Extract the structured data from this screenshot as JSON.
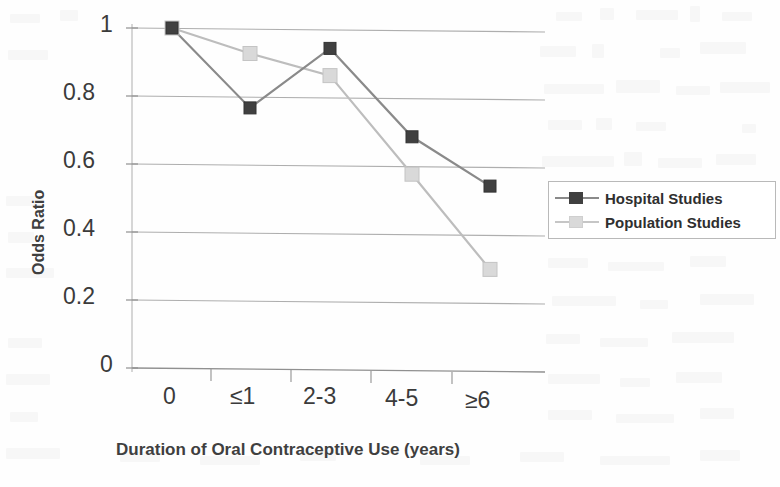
{
  "chart_data": {
    "type": "line",
    "title": "",
    "xlabel": "Duration of Oral Contraceptive Use (years)",
    "ylabel": "Odds Ratio",
    "categories": [
      "0",
      "≤1",
      "2-3",
      "4-5",
      "≥6"
    ],
    "ylim": [
      0,
      1
    ],
    "yticks": [
      "0",
      "0.2",
      "0.4",
      "0.6",
      "0.8",
      "1"
    ],
    "ytick_values": [
      0,
      0.2,
      0.4,
      0.6,
      0.8,
      1
    ],
    "grid": "horizontal",
    "legend_position": "right-middle",
    "series": [
      {
        "name": "Hospital Studies",
        "color": "#404040",
        "marker": "square",
        "values": [
          1.0,
          0.765,
          0.94,
          0.68,
          0.535
        ]
      },
      {
        "name": "Population Studies",
        "color": "#d6d6d6",
        "marker": "square",
        "values": [
          1.0,
          0.925,
          0.86,
          0.57,
          0.29
        ]
      }
    ]
  },
  "axes": {
    "y_title": "Odds Ratio",
    "x_title": "Duration of Oral Contraceptive Use (years)",
    "y_ticks": [
      "1",
      "0.8",
      "0.6",
      "0.4",
      "0.2",
      "0"
    ],
    "x_ticks": [
      "0",
      "≤1",
      "2-3",
      "4-5",
      "≥6"
    ]
  },
  "legend": {
    "items": [
      {
        "label": "Hospital Studies",
        "color": "#404040"
      },
      {
        "label": "Population Studies",
        "color": "#d6d6d6"
      }
    ]
  },
  "colors": {
    "hospital": "#404040",
    "population": "#d6d6d6",
    "grid": "#a8a8a8",
    "axis": "#9a9a9a",
    "text": "#3b3b3b"
  }
}
